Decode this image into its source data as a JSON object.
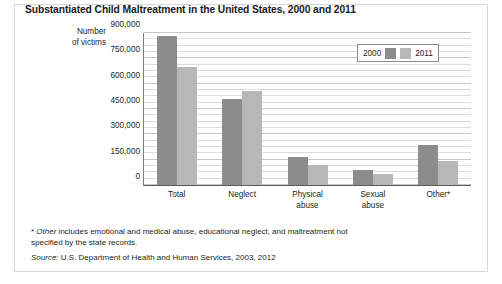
{
  "figure": {
    "title": "Substantiated Child Maltreatment in the United States, 2000 and 2011",
    "axis_title_line1": "Number",
    "axis_title_line2": "of victims",
    "footnote_marker": "*",
    "footnote_term": "Other",
    "footnote_text": " includes emotional and medical abuse, educational neglect, and maltreatment not specified by the state records.",
    "source_label": "Source:",
    "source_text": " U.S. Department of Health and Human Services, 2003, 2012",
    "colors": {
      "series_2000": "#8c8c8c",
      "series_2011": "#b7b7b7",
      "frame_border": "#d9d9d9",
      "gridline": "#dcdcdc",
      "axis": "#5a5a5a"
    }
  },
  "chart_data": {
    "type": "bar",
    "title": "Substantiated Child Maltreatment in the United States, 2000 and 2011",
    "xlabel": "",
    "ylabel": "Number of victims",
    "categories": [
      "Total",
      "Neglect",
      "Physical\nabuse",
      "Sexual\nabuse",
      "Other*"
    ],
    "series": [
      {
        "name": "2000",
        "values": [
          880000,
          510000,
          167000,
          88000,
          235000
        ]
      },
      {
        "name": "2011",
        "values": [
          700000,
          555000,
          120000,
          63000,
          140000
        ]
      }
    ],
    "ylim": [
      0,
      900000
    ],
    "ytick_values": [
      0,
      150000,
      300000,
      450000,
      600000,
      750000,
      900000
    ],
    "ytick_labels": [
      "0",
      "150,000",
      "300,000",
      "450,000",
      "600,000",
      "750,000",
      "900,000"
    ],
    "minor_tick_step": 37500,
    "grid": true,
    "legend": [
      "2000",
      "2011"
    ],
    "legend_position": "top-right"
  }
}
